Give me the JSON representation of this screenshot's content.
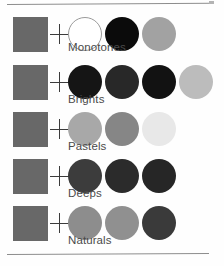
{
  "page": {
    "background_color": "#fefefe",
    "rule_color": "#8d8d8d",
    "swatch_square_color": "#686868",
    "plus_symbol": "+",
    "label_color": "#4a4a4a"
  },
  "rows": [
    {
      "label": "Monotones",
      "top": 17,
      "label_top": 41,
      "base_square_color": "#686868",
      "dots": [
        {
          "name": "white",
          "color": "#ffffff",
          "outlined": true
        },
        {
          "name": "black",
          "color": "#0b0b0b",
          "outlined": false
        },
        {
          "name": "mid-gray",
          "color": "#a2a2a2",
          "outlined": false
        }
      ]
    },
    {
      "label": "Brights",
      "top": 65,
      "label_top": 93,
      "base_square_color": "#686868",
      "dots": [
        {
          "name": "near-black-1",
          "color": "#151515",
          "outlined": false
        },
        {
          "name": "near-black-2",
          "color": "#282828",
          "outlined": false
        },
        {
          "name": "near-black-3",
          "color": "#121212",
          "outlined": false
        },
        {
          "name": "light-gray",
          "color": "#bcbcbc",
          "outlined": false
        }
      ]
    },
    {
      "label": "Pastels",
      "top": 112,
      "label_top": 140,
      "base_square_color": "#686868",
      "dots": [
        {
          "name": "light-gray",
          "color": "#a8a8a8",
          "outlined": false
        },
        {
          "name": "mid-gray",
          "color": "#868686",
          "outlined": false
        },
        {
          "name": "very-light-gray",
          "color": "#e8e8e8",
          "outlined": false
        }
      ]
    },
    {
      "label": "Deeps",
      "top": 159,
      "label_top": 187,
      "base_square_color": "#686868",
      "dots": [
        {
          "name": "dark-gray",
          "color": "#3c3c3c",
          "outlined": false
        },
        {
          "name": "darker-gray",
          "color": "#2b2b2b",
          "outlined": false
        },
        {
          "name": "darkest-gray",
          "color": "#262626",
          "outlined": false
        }
      ]
    },
    {
      "label": "Naturals",
      "top": 206,
      "label_top": 234,
      "base_square_color": "#686868",
      "dots": [
        {
          "name": "mid-gray-1",
          "color": "#8d8d8d",
          "outlined": false
        },
        {
          "name": "mid-gray-2",
          "color": "#909090",
          "outlined": false
        },
        {
          "name": "dark-gray",
          "color": "#3a3a3a",
          "outlined": false
        }
      ]
    }
  ]
}
